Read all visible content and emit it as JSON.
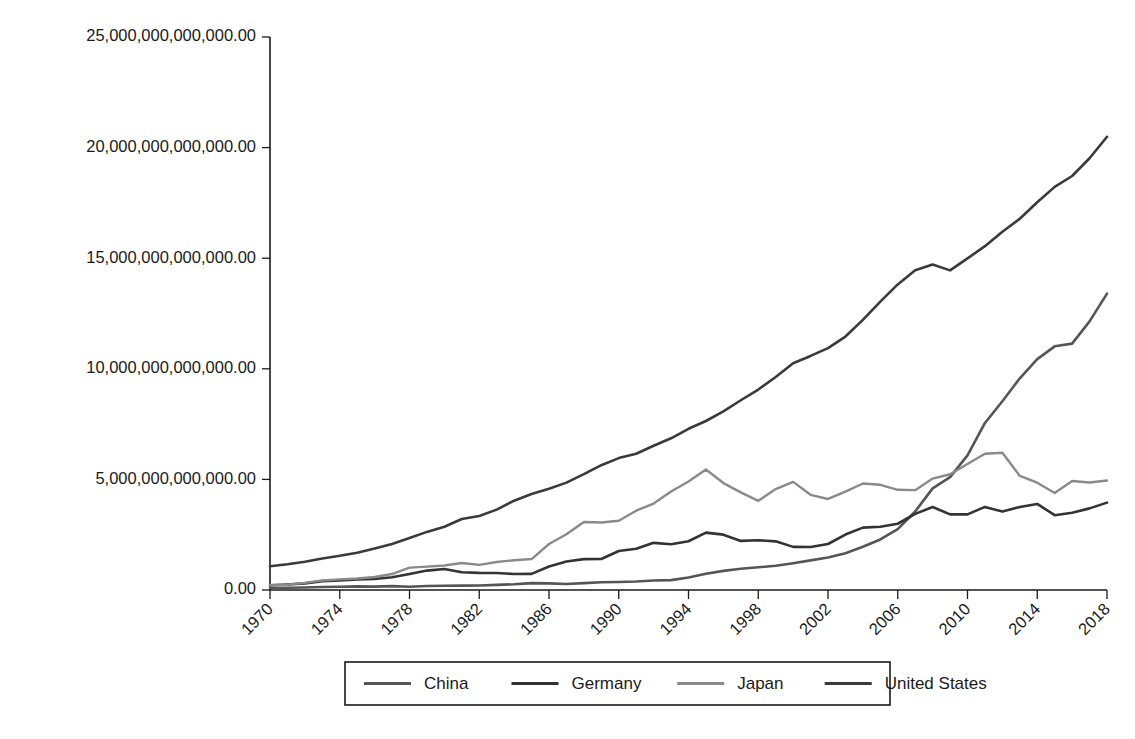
{
  "chart_data": {
    "type": "line",
    "title": "",
    "subtitle": "",
    "xlabel": "",
    "ylabel": "",
    "grid": false,
    "legend_position": "bottom",
    "x": [
      1970,
      1971,
      1972,
      1973,
      1974,
      1975,
      1976,
      1977,
      1978,
      1979,
      1980,
      1981,
      1982,
      1983,
      1984,
      1985,
      1986,
      1987,
      1988,
      1989,
      1990,
      1991,
      1992,
      1993,
      1994,
      1995,
      1996,
      1997,
      1998,
      1999,
      2000,
      2001,
      2002,
      2003,
      2004,
      2005,
      2006,
      2007,
      2008,
      2009,
      2010,
      2011,
      2012,
      2013,
      2014,
      2015,
      2016,
      2017,
      2018
    ],
    "xtick_labels": [
      "1970",
      "1974",
      "1978",
      "1982",
      "1986",
      "1990",
      "1994",
      "1998",
      "2002",
      "2006",
      "2010",
      "2014",
      "2018"
    ],
    "xtick_values": [
      1970,
      1974,
      1978,
      1982,
      1986,
      1990,
      1994,
      1998,
      2002,
      2006,
      2010,
      2014,
      2018
    ],
    "ytick_labels": [
      "0.00",
      "5,000,000,000,000.00",
      "10,000,000,000,000.00",
      "15,000,000,000,000.00",
      "20,000,000,000,000.00",
      "25,000,000,000,000.00"
    ],
    "ytick_values": [
      0,
      5000000000000,
      10000000000000,
      15000000000000,
      20000000000000,
      25000000000000
    ],
    "ylim": [
      0,
      25000000000000
    ],
    "xlim": [
      1970,
      2018
    ],
    "series": [
      {
        "name": "China",
        "color": "#555555",
        "values": [
          92600000000,
          99800000000,
          113700000000,
          138500000000,
          144200000000,
          163400000000,
          153900000000,
          174900000000,
          149500000000,
          178300000000,
          191100000000,
          195900000000,
          205100000000,
          230700000000,
          259900000000,
          309500000000,
          300800000000,
          272900000000,
          312300000000,
          347800000000,
          360900000000,
          383400000000,
          426900000000,
          444700000000,
          564300000000,
          734500000000,
          863700000000,
          961600000000,
          1029000000000,
          1094000000000,
          1211300000000,
          1339400000000,
          1470600000000,
          1660300000000,
          1955300000000,
          2285900000000,
          2752100000000,
          3550300000000,
          4594300000000,
          5101700000000,
          6087200000000,
          7551500000000,
          8532200000000,
          9570400000000,
          10438500000000,
          11015500000000,
          11137900000000,
          12143500000000,
          13400000000000
        ]
      },
      {
        "name": "Germany",
        "color": "#333333",
        "values": [
          215800000000,
          250700000000,
          298300000000,
          400000000000,
          436000000000,
          475400000000,
          500200000000,
          576900000000,
          723900000000,
          878100000000,
          946700000000,
          800200000000,
          772300000000,
          770600000000,
          726600000000,
          730100000000,
          1060000000000,
          1291000000000,
          1394000000000,
          1400000000000,
          1764000000000,
          1868000000000,
          2132000000000,
          2066000000000,
          2205000000000,
          2594000000000,
          2502000000000,
          2219000000000,
          2246000000000,
          2200000000000,
          1950000000000,
          1944000000000,
          2080000000000,
          2508000000000,
          2819000000000,
          2861000000000,
          2995000000000,
          3440000000000,
          3752000000000,
          3418000000000,
          3417000000000,
          3757000000000,
          3544000000000,
          3753000000000,
          3890000000000,
          3383000000000,
          3496000000000,
          3690000000000,
          3950000000000
        ]
      },
      {
        "name": "Japan",
        "color": "#8a8a8a",
        "values": [
          217600000000,
          240700000000,
          319700000000,
          432600000000,
          479200000000,
          521700000000,
          586100000000,
          721400000000,
          1012000000000,
          1058000000000,
          1105000000000,
          1218000000000,
          1137000000000,
          1265000000000,
          1347000000000,
          1399000000000,
          2081000000000,
          2517000000000,
          3072000000000,
          3054000000000,
          3133000000000,
          3585000000000,
          3909000000000,
          4454000000000,
          4907000000000,
          5449000000000,
          4834000000000,
          4415000000000,
          4032000000000,
          4562000000000,
          4888000000000,
          4303000000000,
          4115000000000,
          4446000000000,
          4815000000000,
          4756000000000,
          4530000000000,
          4515000000000,
          5038000000000,
          5231000000000,
          5700000000000,
          6157000000000,
          6203000000000,
          5156000000000,
          4850000000000,
          4389000000000,
          4927000000000,
          4860000000000,
          4950000000000
        ]
      },
      {
        "name": "United States",
        "color": "#3a3a3a",
        "values": [
          1073000000000,
          1165000000000,
          1279000000000,
          1425000000000,
          1545000000000,
          1685000000000,
          1873000000000,
          2082000000000,
          2352000000000,
          2627000000000,
          2857000000000,
          3207000000000,
          3344000000000,
          3634000000000,
          4038000000000,
          4339000000000,
          4580000000000,
          4855000000000,
          5236000000000,
          5642000000000,
          5963000000000,
          6158000000000,
          6520000000000,
          6859000000000,
          7287000000000,
          7640000000000,
          8073000000000,
          8578000000000,
          9063000000000,
          9631000000000,
          10250000000000,
          10582000000000,
          10936000000000,
          11458000000000,
          12214000000000,
          13037000000000,
          13815000000000,
          14452000000000,
          14713000000000,
          14449000000000,
          14992000000000,
          15543000000000,
          16197000000000,
          16785000000000,
          17527000000000,
          18225000000000,
          18715000000000,
          19519000000000,
          20490000000000
        ]
      }
    ]
  },
  "legend": {
    "entries": [
      {
        "label": "China",
        "color": "#555555"
      },
      {
        "label": "Germany",
        "color": "#333333"
      },
      {
        "label": "Japan",
        "color": "#8a8a8a"
      },
      {
        "label": "United States",
        "color": "#3a3a3a"
      }
    ]
  },
  "colors": {
    "axis": "#1a1a1a",
    "background": "#ffffff",
    "china": "#555555",
    "germany": "#333333",
    "japan": "#8a8a8a",
    "united_states": "#3a3a3a"
  }
}
